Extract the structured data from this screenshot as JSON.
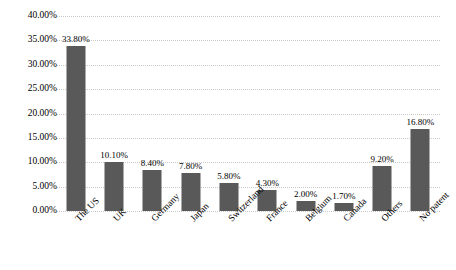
{
  "chart_data": {
    "type": "bar",
    "title": "",
    "subtitle": "",
    "xlabel": "",
    "ylabel": "",
    "ylim": [
      0,
      40
    ],
    "ytick_step": 5,
    "grid": true,
    "grid_axis": "y",
    "legend": false,
    "legend_position": "none",
    "bar_color": "#595959",
    "gridline_color": "#c9c9c9",
    "text_color": "#000000",
    "background_color": "#ffffff",
    "value_suffix": "%",
    "categories": [
      "The US",
      "UK",
      "Germany",
      "Japan",
      "Switzerland",
      "France",
      "Belgium",
      "Canada",
      "Others",
      "No patent"
    ],
    "values": [
      33.8,
      10.1,
      8.4,
      7.8,
      5.8,
      4.3,
      2.0,
      1.7,
      9.2,
      16.8
    ],
    "value_labels": [
      "33.80%",
      "10.10%",
      "8.40%",
      "7.80%",
      "5.80%",
      "4.30%",
      "2.00%",
      "1.70%",
      "9.20%",
      "16.80%"
    ],
    "ytick_labels": [
      "0.00%",
      "5.00%",
      "10.00%",
      "15.00%",
      "20.00%",
      "25.00%",
      "30.00%",
      "35.00%",
      "40.00%"
    ],
    "ytick_values": [
      0,
      5,
      10,
      15,
      20,
      25,
      30,
      35,
      40
    ]
  }
}
